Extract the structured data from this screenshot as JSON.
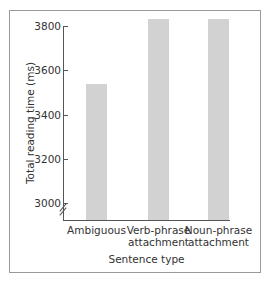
{
  "chart_data": {
    "type": "bar",
    "title": "",
    "xlabel": "Sentence type",
    "ylabel": "Total reading time (ms)",
    "categories": [
      "Ambiguous",
      "Verb-phrase attachment",
      "Noun-phrase attachment"
    ],
    "category_lines": [
      [
        "Ambiguous"
      ],
      [
        "Verb-phrase",
        "attachment"
      ],
      [
        "Noun-phrase",
        "attachment"
      ]
    ],
    "values": [
      3540,
      3830,
      3830
    ],
    "yticks": [
      3000,
      3200,
      3400,
      3600,
      3800
    ],
    "ylim": [
      2920,
      3830
    ],
    "axis_break": true,
    "grid": false,
    "legend": null,
    "bar_color": "#d2d2d2"
  }
}
